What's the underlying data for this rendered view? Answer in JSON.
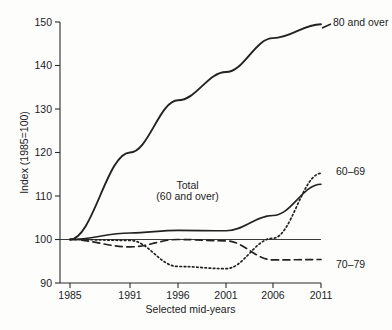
{
  "chart_data": {
    "type": "line",
    "title": "",
    "xlabel": "Selected mid-years",
    "ylabel": "Index (1985=100)",
    "x": [
      1985,
      1991,
      1996,
      2001,
      2006,
      2011
    ],
    "xticklabels": [
      "1985",
      "1991",
      "1996",
      "2001",
      "2006",
      "2011"
    ],
    "xlim": [
      1985,
      2011
    ],
    "ylim": [
      90,
      150
    ],
    "yticks": [
      90,
      100,
      110,
      120,
      130,
      140,
      150
    ],
    "yticklabels": [
      "90",
      "100",
      "110",
      "120",
      "130",
      "140",
      "150"
    ],
    "grid": false,
    "legend_position": "right-inline-labels",
    "reference_line": 100,
    "series": [
      {
        "name": "80 and over",
        "style": "solid",
        "label": "80 and over",
        "x": [
          1985,
          1991,
          1996,
          2001,
          2006,
          2011
        ],
        "values": [
          100.0,
          120.0,
          132.0,
          138.5,
          146.3,
          149.5
        ]
      },
      {
        "name": "Total (60 and over)",
        "style": "solid-thin",
        "label": "Total\n(60 and over)",
        "label_line1": "Total",
        "label_line2": "(60 and over)",
        "x": [
          1985,
          1991,
          1996,
          2001,
          2006,
          2011
        ],
        "values": [
          100.0,
          101.5,
          102.1,
          102.0,
          105.5,
          112.7
        ]
      },
      {
        "name": "70-79",
        "style": "dashed",
        "label": "70–79",
        "x": [
          1985,
          1991,
          1996,
          2001,
          2006,
          2011
        ],
        "values": [
          100.0,
          98.3,
          100.0,
          99.7,
          95.3,
          95.4
        ]
      },
      {
        "name": "60-69",
        "style": "dotted",
        "label": "60–69",
        "x": [
          1985,
          1991,
          1996,
          2001,
          2006,
          2011
        ],
        "values": [
          100.0,
          99.8,
          93.8,
          93.3,
          100.3,
          115.2
        ]
      }
    ],
    "annotations": [
      {
        "text": "Total",
        "x": 1997.0,
        "y": 111.5
      },
      {
        "text": "(60 and over)",
        "x": 1997.0,
        "y": 109.0
      }
    ]
  }
}
